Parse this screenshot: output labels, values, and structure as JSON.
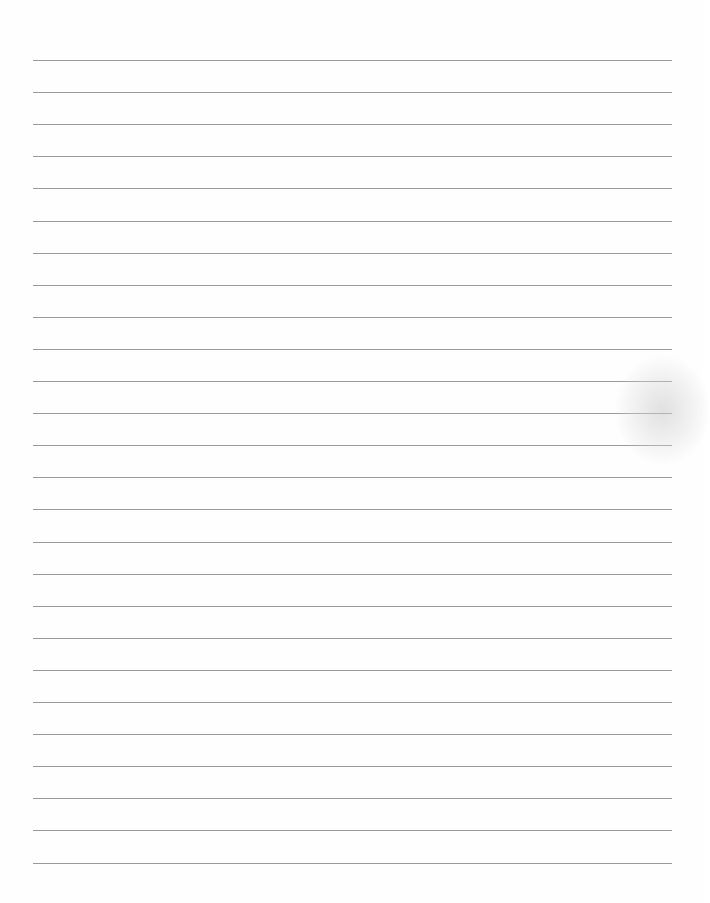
{
  "page": {
    "type": "lined-paper",
    "background_color": "#fefefe",
    "rule_color": "#9a9a9a",
    "rule_count": 26,
    "first_rule_y": 60,
    "rule_spacing": 32.1,
    "rule_left": 33,
    "rule_right": 672,
    "text_content": []
  }
}
